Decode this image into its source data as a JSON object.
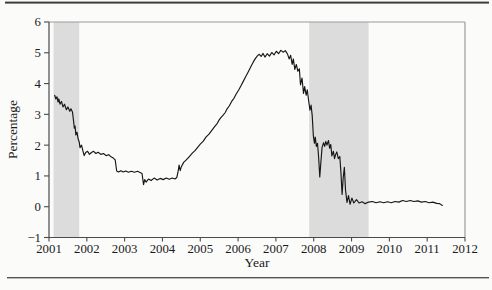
{
  "chart_data": {
    "type": "line",
    "title": "",
    "xlabel": "Year",
    "ylabel": "Percentage",
    "xlim": [
      2001,
      2012
    ],
    "ylim": [
      -1,
      6
    ],
    "grid": false,
    "legend": "none",
    "x_ticks": [
      2001,
      2002,
      2003,
      2004,
      2005,
      2006,
      2007,
      2008,
      2009,
      2010,
      2011,
      2012
    ],
    "x_tick_labels": [
      "2001",
      "2002",
      "2003",
      "2004",
      "2005",
      "2006",
      "2007",
      "2008",
      "2009",
      "2010",
      "2011",
      "2012"
    ],
    "y_ticks": [
      -1,
      0,
      1,
      2,
      3,
      4,
      5,
      6
    ],
    "y_tick_labels": [
      "−1",
      "0",
      "1",
      "2",
      "3",
      "4",
      "5",
      "6"
    ],
    "line_color": "#161616",
    "band_color": "#dcdcdc",
    "axis_color": "#4a4a4a",
    "frame_color": "#9b9b9b",
    "shaded_bands": [
      {
        "from": 2001.12,
        "to": 2001.8
      },
      {
        "from": 2007.88,
        "to": 2009.45
      }
    ],
    "series": [
      {
        "name": "rate",
        "points": [
          [
            2001.15,
            3.62
          ],
          [
            2001.18,
            3.5
          ],
          [
            2001.21,
            3.57
          ],
          [
            2001.24,
            3.4
          ],
          [
            2001.26,
            3.5
          ],
          [
            2001.29,
            3.33
          ],
          [
            2001.33,
            3.42
          ],
          [
            2001.37,
            3.24
          ],
          [
            2001.41,
            3.33
          ],
          [
            2001.46,
            3.15
          ],
          [
            2001.5,
            3.24
          ],
          [
            2001.55,
            3.1
          ],
          [
            2001.58,
            3.18
          ],
          [
            2001.62,
            3.08
          ],
          [
            2001.65,
            2.78
          ],
          [
            2001.67,
            2.55
          ],
          [
            2001.69,
            2.62
          ],
          [
            2001.71,
            2.33
          ],
          [
            2001.74,
            2.42
          ],
          [
            2001.77,
            2.2
          ],
          [
            2001.8,
            2.1
          ],
          [
            2001.82,
            1.92
          ],
          [
            2001.86,
            2.0
          ],
          [
            2001.9,
            1.8
          ],
          [
            2001.93,
            1.66
          ],
          [
            2001.97,
            1.76
          ],
          [
            2002.02,
            1.8
          ],
          [
            2002.07,
            1.7
          ],
          [
            2002.12,
            1.76
          ],
          [
            2002.18,
            1.8
          ],
          [
            2002.24,
            1.73
          ],
          [
            2002.3,
            1.77
          ],
          [
            2002.37,
            1.7
          ],
          [
            2002.44,
            1.73
          ],
          [
            2002.51,
            1.66
          ],
          [
            2002.58,
            1.69
          ],
          [
            2002.64,
            1.62
          ],
          [
            2002.7,
            1.58
          ],
          [
            2002.75,
            1.52
          ],
          [
            2002.79,
            1.16
          ],
          [
            2002.84,
            1.13
          ],
          [
            2002.9,
            1.17
          ],
          [
            2002.96,
            1.13
          ],
          [
            2003.03,
            1.16
          ],
          [
            2003.1,
            1.12
          ],
          [
            2003.18,
            1.15
          ],
          [
            2003.26,
            1.12
          ],
          [
            2003.34,
            1.15
          ],
          [
            2003.41,
            1.11
          ],
          [
            2003.46,
            1.08
          ],
          [
            2003.5,
            0.72
          ],
          [
            2003.53,
            0.88
          ],
          [
            2003.57,
            0.8
          ],
          [
            2003.63,
            0.9
          ],
          [
            2003.7,
            0.85
          ],
          [
            2003.78,
            0.93
          ],
          [
            2003.86,
            0.87
          ],
          [
            2003.94,
            0.92
          ],
          [
            2004.02,
            0.88
          ],
          [
            2004.1,
            0.93
          ],
          [
            2004.18,
            0.89
          ],
          [
            2004.26,
            0.93
          ],
          [
            2004.33,
            0.9
          ],
          [
            2004.38,
            0.95
          ],
          [
            2004.41,
            1.12
          ],
          [
            2004.44,
            1.35
          ],
          [
            2004.47,
            1.17
          ],
          [
            2004.5,
            1.3
          ],
          [
            2004.56,
            1.44
          ],
          [
            2004.63,
            1.52
          ],
          [
            2004.71,
            1.63
          ],
          [
            2004.79,
            1.74
          ],
          [
            2004.86,
            1.82
          ],
          [
            2004.93,
            1.93
          ],
          [
            2005.0,
            2.03
          ],
          [
            2005.08,
            2.13
          ],
          [
            2005.15,
            2.26
          ],
          [
            2005.23,
            2.36
          ],
          [
            2005.31,
            2.49
          ],
          [
            2005.38,
            2.6
          ],
          [
            2005.45,
            2.71
          ],
          [
            2005.5,
            2.82
          ],
          [
            2005.55,
            2.9
          ],
          [
            2005.6,
            2.97
          ],
          [
            2005.66,
            3.06
          ],
          [
            2005.71,
            3.18
          ],
          [
            2005.77,
            3.28
          ],
          [
            2005.83,
            3.42
          ],
          [
            2005.89,
            3.52
          ],
          [
            2005.95,
            3.66
          ],
          [
            2006.02,
            3.8
          ],
          [
            2006.08,
            3.94
          ],
          [
            2006.14,
            4.08
          ],
          [
            2006.2,
            4.22
          ],
          [
            2006.26,
            4.36
          ],
          [
            2006.31,
            4.48
          ],
          [
            2006.36,
            4.6
          ],
          [
            2006.41,
            4.72
          ],
          [
            2006.46,
            4.82
          ],
          [
            2006.51,
            4.9
          ],
          [
            2006.56,
            4.95
          ],
          [
            2006.61,
            4.88
          ],
          [
            2006.66,
            4.98
          ],
          [
            2006.71,
            4.86
          ],
          [
            2006.77,
            4.97
          ],
          [
            2006.83,
            4.89
          ],
          [
            2006.89,
            5.01
          ],
          [
            2006.95,
            4.93
          ],
          [
            2007.01,
            5.05
          ],
          [
            2007.07,
            4.97
          ],
          [
            2007.13,
            5.08
          ],
          [
            2007.19,
            5.02
          ],
          [
            2007.25,
            5.07
          ],
          [
            2007.31,
            4.95
          ],
          [
            2007.35,
            4.8
          ],
          [
            2007.39,
            4.92
          ],
          [
            2007.43,
            4.62
          ],
          [
            2007.46,
            4.8
          ],
          [
            2007.5,
            4.46
          ],
          [
            2007.54,
            4.62
          ],
          [
            2007.58,
            4.4
          ],
          [
            2007.62,
            4.48
          ],
          [
            2007.65,
            3.96
          ],
          [
            2007.69,
            4.18
          ],
          [
            2007.73,
            3.68
          ],
          [
            2007.76,
            3.9
          ],
          [
            2007.8,
            3.62
          ],
          [
            2007.83,
            3.8
          ],
          [
            2007.87,
            3.4
          ],
          [
            2007.9,
            3.14
          ],
          [
            2007.93,
            3.3
          ],
          [
            2007.96,
            2.96
          ],
          [
            2007.99,
            2.3
          ],
          [
            2008.02,
            2.06
          ],
          [
            2008.04,
            2.26
          ],
          [
            2008.07,
            1.96
          ],
          [
            2008.1,
            2.06
          ],
          [
            2008.13,
            1.6
          ],
          [
            2008.16,
            0.97
          ],
          [
            2008.19,
            1.46
          ],
          [
            2008.22,
            1.92
          ],
          [
            2008.26,
            2.08
          ],
          [
            2008.29,
            1.96
          ],
          [
            2008.32,
            2.12
          ],
          [
            2008.35,
            2.0
          ],
          [
            2008.39,
            2.15
          ],
          [
            2008.42,
            1.9
          ],
          [
            2008.45,
            2.02
          ],
          [
            2008.48,
            1.65
          ],
          [
            2008.52,
            1.8
          ],
          [
            2008.55,
            1.56
          ],
          [
            2008.58,
            1.7
          ],
          [
            2008.61,
            1.78
          ],
          [
            2008.65,
            1.56
          ],
          [
            2008.69,
            1.63
          ],
          [
            2008.72,
            1.1
          ],
          [
            2008.75,
            0.4
          ],
          [
            2008.78,
            0.95
          ],
          [
            2008.81,
            1.28
          ],
          [
            2008.84,
            0.55
          ],
          [
            2008.88,
            0.14
          ],
          [
            2008.92,
            0.36
          ],
          [
            2008.96,
            0.08
          ],
          [
            2009.01,
            0.28
          ],
          [
            2009.06,
            0.12
          ],
          [
            2009.13,
            0.23
          ],
          [
            2009.2,
            0.12
          ],
          [
            2009.28,
            0.16
          ],
          [
            2009.36,
            0.1
          ],
          [
            2009.45,
            0.15
          ],
          [
            2009.55,
            0.17
          ],
          [
            2009.65,
            0.13
          ],
          [
            2009.75,
            0.16
          ],
          [
            2009.85,
            0.13
          ],
          [
            2009.95,
            0.16
          ],
          [
            2010.05,
            0.13
          ],
          [
            2010.15,
            0.17
          ],
          [
            2010.25,
            0.15
          ],
          [
            2010.35,
            0.2
          ],
          [
            2010.45,
            0.17
          ],
          [
            2010.55,
            0.2
          ],
          [
            2010.65,
            0.17
          ],
          [
            2010.75,
            0.19
          ],
          [
            2010.85,
            0.15
          ],
          [
            2010.95,
            0.17
          ],
          [
            2011.05,
            0.13
          ],
          [
            2011.15,
            0.15
          ],
          [
            2011.25,
            0.11
          ],
          [
            2011.33,
            0.1
          ],
          [
            2011.4,
            0.04
          ]
        ]
      }
    ]
  }
}
